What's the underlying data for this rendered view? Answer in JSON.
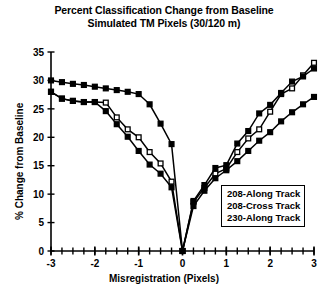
{
  "chart_data": {
    "type": "line",
    "title": "Percent Classification Change from Baseline",
    "subtitle": "Simulated TM Pixels (30/120 m)",
    "xlabel": "Misregistration (Pixels)",
    "ylabel": "% Change from Baseline",
    "xlim": [
      -3,
      3
    ],
    "ylim": [
      0,
      35
    ],
    "xticks": [
      -3,
      -2,
      -1,
      0,
      1,
      2,
      3
    ],
    "xtick_labels": [
      "-3",
      "-2",
      "-1",
      "0",
      "1",
      "2",
      "3"
    ],
    "yticks": [
      0,
      5,
      10,
      15,
      20,
      25,
      30,
      35
    ],
    "ytick_labels": [
      "0",
      "5",
      "10",
      "15",
      "20",
      "25",
      "30",
      "35"
    ],
    "minor_xtick_step": 0.25,
    "grid": false,
    "legend_position": "lower-right",
    "series": [
      {
        "name": "208-Along Track",
        "marker": "open-square",
        "x": [
          -3,
          -2.75,
          -2.5,
          -2.25,
          -2,
          -1.75,
          -1.5,
          -1.25,
          -1,
          -0.75,
          -0.5,
          -0.25,
          0,
          0.25,
          0.5,
          0.75,
          1,
          1.25,
          1.5,
          1.75,
          2,
          2.25,
          2.5,
          2.75,
          3
        ],
        "y": [
          28,
          26.8,
          26.4,
          26.2,
          26.2,
          26.1,
          23.5,
          21.4,
          20,
          17.4,
          15.4,
          12.2,
          0,
          8.6,
          11.1,
          13.6,
          14.5,
          17.4,
          19.8,
          21.4,
          24.5,
          27.6,
          28.6,
          30.9,
          33.1
        ]
      },
      {
        "name": "208-Cross Track",
        "marker": "filled-square",
        "x": [
          -3,
          -2.75,
          -2.5,
          -2.25,
          -2,
          -1.75,
          -1.5,
          -1.25,
          -1,
          -0.75,
          -0.5,
          -0.25,
          0,
          0.25,
          0.5,
          0.75,
          1,
          1.25,
          1.5,
          1.75,
          2,
          2.25,
          2.5,
          2.75,
          3
        ],
        "y": [
          30,
          29.7,
          29.4,
          29.2,
          28.9,
          28.6,
          28.3,
          28,
          27.6,
          25.8,
          22.4,
          18.8,
          0,
          8.8,
          11.6,
          14.6,
          15.1,
          18.9,
          21.1,
          24.2,
          25.7,
          27.8,
          29.8,
          30.7,
          32.1
        ]
      },
      {
        "name": "230-Along Track",
        "marker": "filled-square",
        "x": [
          -3,
          -2.75,
          -2.5,
          -2.25,
          -2,
          -1.75,
          -1.5,
          -1.25,
          -1,
          -0.75,
          -0.5,
          -0.25,
          0,
          0.25,
          0.5,
          0.75,
          1,
          1.25,
          1.5,
          1.75,
          2,
          2.25,
          2.5,
          2.75,
          3
        ],
        "y": [
          28,
          26.8,
          26.4,
          26.2,
          26.2,
          24.6,
          22.3,
          20.1,
          17.6,
          15.2,
          13.6,
          11.2,
          0,
          7.9,
          10.6,
          12.8,
          14.2,
          15.8,
          17.6,
          19.4,
          20.9,
          22.8,
          24.4,
          25.8,
          27.1
        ]
      }
    ],
    "legend_entries": [
      "208-Along Track",
      "208-Cross Track",
      "230-Along Track"
    ]
  },
  "colors": {
    "axis": "#000000",
    "series": "#000000",
    "background": "#ffffff"
  }
}
